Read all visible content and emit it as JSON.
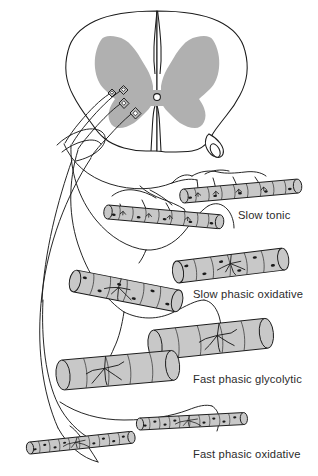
{
  "figure": {
    "background_color": "#ffffff",
    "ink_color": "#1a1a1a",
    "gray_matter_color": "#b0b0b0",
    "muscle_fill_color": "#c8c8c8",
    "label_color": "#2b2b2b"
  },
  "spinal_cord": {
    "name": "spinal-cord-cross-section",
    "white_matter_label": "white matter outline",
    "gray_matter_label": "butterfly-shaped gray matter",
    "central_canal_label": "central canal",
    "ventral_root_label": "ventral root",
    "dorsal_median_sulcus_label": "dorsal median sulcus",
    "ventral_median_fissure_label": "ventral median fissure"
  },
  "motor_neurons": [
    {
      "id": "mn-1",
      "name": "motor-neuron-soma-slow-tonic",
      "size": "smallest"
    },
    {
      "id": "mn-2",
      "name": "motor-neuron-soma-slow-phasic-oxidative",
      "size": "small"
    },
    {
      "id": "mn-3",
      "name": "motor-neuron-soma-fast-phasic-glycolytic",
      "size": "medium"
    },
    {
      "id": "mn-4",
      "name": "motor-neuron-soma-fast-phasic-oxidative",
      "size": "large"
    }
  ],
  "motor_unit_groups": [
    {
      "id": "slow-tonic",
      "label": "Slow tonic",
      "label_x": 238,
      "label_y": 219,
      "fiber_count": 2,
      "fiber_diameter": "small",
      "innervation": "multi-terminal en grappe",
      "endplates_per_fiber": 4
    },
    {
      "id": "slow-phasic-oxidative",
      "label": "Slow phasic oxidative",
      "label_x": 193,
      "label_y": 298,
      "fiber_count": 2,
      "fiber_diameter": "medium",
      "innervation": "single arborizing endplate",
      "endplates_per_fiber": 1
    },
    {
      "id": "fast-phasic-glycolytic",
      "label": "Fast phasic glycolytic",
      "label_x": 193,
      "label_y": 383,
      "fiber_count": 2,
      "fiber_diameter": "large",
      "innervation": "single arborizing endplate",
      "endplates_per_fiber": 1
    },
    {
      "id": "fast-phasic-oxidative",
      "label": "Fast phasic oxidative",
      "label_x": 193,
      "label_y": 458,
      "fiber_count": 2,
      "fiber_diameter": "smallest",
      "innervation": "single arborizing endplate",
      "endplates_per_fiber": 1
    }
  ]
}
